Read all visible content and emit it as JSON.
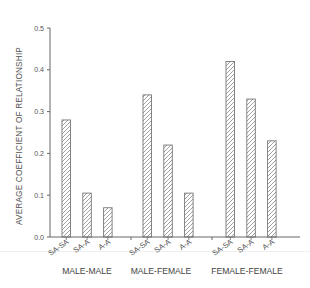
{
  "chart_data": {
    "type": "bar",
    "title": "",
    "xlabel": "",
    "ylabel": "AVERAGE COEFFICIENT OF RELATIONSHIP",
    "ylim": [
      0.0,
      0.5
    ],
    "yticks": [
      "0.0",
      "0.1",
      "0.2",
      "0.3",
      "0.4",
      "0.5"
    ],
    "grid": false,
    "legend": null,
    "groups": [
      {
        "label": "MALE-MALE",
        "categories": [
          "SA-SA",
          "SA-A",
          "A-A"
        ],
        "values": [
          0.28,
          0.105,
          0.07
        ]
      },
      {
        "label": "MALE-FEMALE",
        "categories": [
          "SA-SA",
          "SA-A",
          "A-A"
        ],
        "values": [
          0.34,
          0.22,
          0.105
        ]
      },
      {
        "label": "FEMALE-FEMALE",
        "categories": [
          "SA-SA",
          "SA-A",
          "A-A"
        ],
        "values": [
          0.42,
          0.33,
          0.23
        ]
      }
    ],
    "bar_fill": "diagonal-hatch",
    "colors": {
      "axis": "#666666",
      "bar_outline": "#777777",
      "hatch": "#8a8a8a",
      "text": "#555555"
    }
  }
}
